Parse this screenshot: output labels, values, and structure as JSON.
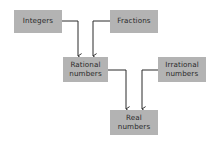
{
  "diagram": {
    "title": "",
    "colors": {
      "node_fill": "#b3b3b3",
      "text": "#2a2a2a",
      "edge": "#2a2a2a",
      "background": "#ffffff"
    },
    "nodes": [
      {
        "id": "integers",
        "lines": [
          "Integers"
        ],
        "x": 14,
        "y": 10,
        "w": 48,
        "h": 23
      },
      {
        "id": "fractions",
        "lines": [
          "Fractions"
        ],
        "x": 110,
        "y": 10,
        "w": 48,
        "h": 23
      },
      {
        "id": "rational",
        "lines": [
          "Rational",
          "numbers"
        ],
        "x": 63,
        "y": 57,
        "w": 45,
        "h": 25
      },
      {
        "id": "irrational",
        "lines": [
          "Irrational",
          "numbers"
        ],
        "x": 158,
        "y": 57,
        "w": 48,
        "h": 25
      },
      {
        "id": "real",
        "lines": [
          "Real",
          "numbers"
        ],
        "x": 110,
        "y": 110,
        "w": 48,
        "h": 25
      }
    ],
    "edges": [
      {
        "from": "integers",
        "to": "rational"
      },
      {
        "from": "fractions",
        "to": "rational"
      },
      {
        "from": "rational",
        "to": "real"
      },
      {
        "from": "irrational",
        "to": "real"
      }
    ]
  }
}
